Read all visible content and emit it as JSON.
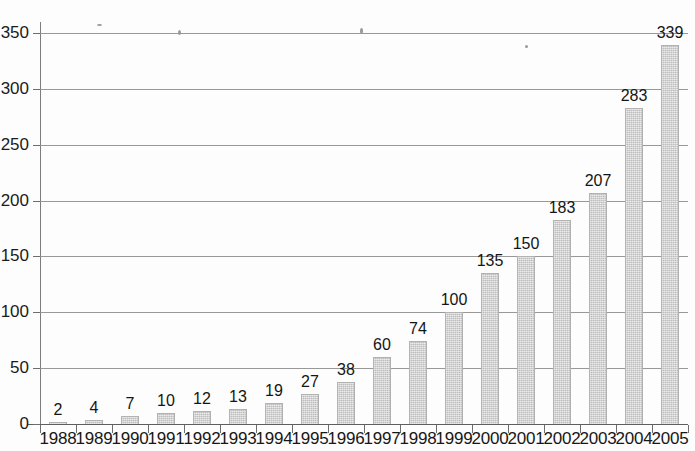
{
  "chart_data": {
    "type": "bar",
    "title": "",
    "subtitle": "",
    "xlabel": "",
    "ylabel": "",
    "categories": [
      "1988",
      "1989",
      "1990",
      "1991",
      "1992",
      "1993",
      "1994",
      "1995",
      "1996",
      "1997",
      "1998",
      "1999",
      "2000",
      "2001",
      "2002",
      "2003",
      "2004",
      "2005"
    ],
    "values": [
      2,
      4,
      7,
      10,
      12,
      13,
      19,
      27,
      38,
      60,
      74,
      100,
      135,
      150,
      183,
      207,
      283,
      339
    ],
    "data_labels": [
      "2",
      "4",
      "7",
      "10",
      "12",
      "13",
      "19",
      "27",
      "38",
      "60",
      "74",
      "100",
      "135",
      "150",
      "183",
      "207",
      "283",
      "339"
    ],
    "ylim": [
      0,
      350
    ],
    "yticks": [
      0,
      50,
      100,
      150,
      200,
      250,
      300,
      350
    ],
    "ytick_labels": [
      "0",
      "50",
      "100",
      "150",
      "200",
      "250",
      "300",
      "350"
    ],
    "grid": "horizontal",
    "legend": "none",
    "bar_color": "#c9c9c9",
    "axis_color": "#5f5f5f",
    "text_color": "#151515",
    "background": "#ffffff"
  }
}
